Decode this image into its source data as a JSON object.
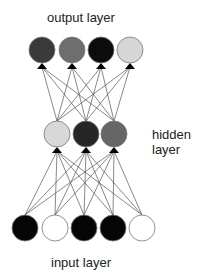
{
  "labels": {
    "output": "output layer",
    "hidden_line1": "hidden",
    "hidden_line2": "layer",
    "input": "input layer"
  },
  "layers": {
    "output": {
      "y": 50,
      "nodes": [
        {
          "x": 42,
          "fill": "#3a3a3a"
        },
        {
          "x": 72,
          "fill": "#6e6e6e"
        },
        {
          "x": 101,
          "fill": "#0c0c0c"
        },
        {
          "x": 130,
          "fill": "#d6d6d6"
        }
      ]
    },
    "hidden": {
      "y": 134,
      "nodes": [
        {
          "x": 57,
          "fill": "#d8d8d8"
        },
        {
          "x": 86,
          "fill": "#262626"
        },
        {
          "x": 114,
          "fill": "#666666"
        }
      ]
    },
    "input": {
      "y": 228,
      "nodes": [
        {
          "x": 25,
          "fill": "#050505"
        },
        {
          "x": 55,
          "fill": "#ffffff"
        },
        {
          "x": 84,
          "fill": "#050505"
        },
        {
          "x": 113,
          "fill": "#050505"
        },
        {
          "x": 142,
          "fill": "#ffffff"
        }
      ]
    }
  },
  "style": {
    "node_radius": 13,
    "edge_color": "#555555",
    "node_stroke": "#777777"
  }
}
